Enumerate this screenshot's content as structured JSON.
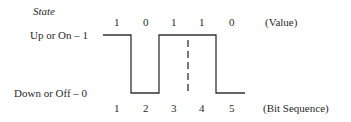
{
  "diagram": {
    "state_label": "State",
    "y_levels": [
      {
        "label": "Up or On – 1",
        "value": 1
      },
      {
        "label": "Down or Off – 0",
        "value": 0
      }
    ],
    "values_row": {
      "values": [
        "1",
        "0",
        "1",
        "1",
        "0"
      ],
      "label": "(Value)"
    },
    "bits_row": {
      "positions": [
        "1",
        "2",
        "3",
        "4",
        "5"
      ],
      "label": "(Bit Sequence)"
    },
    "line_color": "#333333"
  }
}
